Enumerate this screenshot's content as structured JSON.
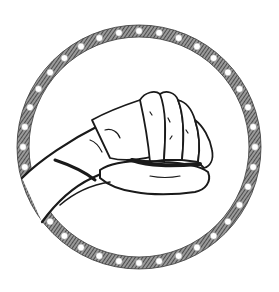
{
  "image": {
    "description": "Black-and-white engraving-style illustration of a clenched fist inside a circular beaded chain border",
    "subject": "clenched-fist",
    "border": "beaded-chain-ring",
    "colors": {
      "background": "#ffffff",
      "ink": "#1a1a1a",
      "hatch": "#555555",
      "bead": "#ffffff"
    },
    "ring": {
      "center_x": 139,
      "center_y": 147,
      "radius": 116,
      "band_width": 12,
      "bead_count": 36
    }
  }
}
